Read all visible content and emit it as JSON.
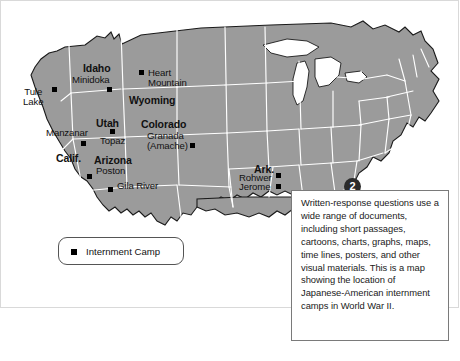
{
  "figure": {
    "type": "annotated-map",
    "title_visible": false,
    "map_region": "Continental United States",
    "map_fill_color": "#9b9b9b",
    "map_border_color": "#ffffff",
    "coastline_color": "#1a1a1a",
    "background_color": "#ffffff"
  },
  "badge": {
    "number": "2",
    "color": "#2b2b2b",
    "text_color": "#ffffff"
  },
  "callout": {
    "text": "Written-response questions use a wide range of documents, including short passages, cartoons, charts, graphs, maps, time lines, posters, and other visual materials. This is a map showing the location of Japanese-American internment camps in World War II.",
    "border_color": "#7a7a7a",
    "background": "#ffffff"
  },
  "legend": {
    "marker_shape": "square",
    "marker_color": "#000000",
    "label": "Internment Camp",
    "border_color": "#555555"
  },
  "states": [
    {
      "name": "Idaho",
      "x": 82,
      "y": 62
    },
    {
      "name": "Wyoming",
      "x": 128,
      "y": 94
    },
    {
      "name": "Utah",
      "x": 95,
      "y": 117
    },
    {
      "name": "Colorado",
      "x": 140,
      "y": 118
    },
    {
      "name": "Calif.",
      "x": 55,
      "y": 152
    },
    {
      "name": "Arizona",
      "x": 93,
      "y": 154
    },
    {
      "name": "Ark.",
      "x": 253,
      "y": 163
    }
  ],
  "camps": [
    {
      "name": "Tule Lake",
      "lines": [
        "Tule",
        "Lake"
      ],
      "label_x": 22,
      "label_y": 86,
      "marker_x": 51,
      "marker_y": 86
    },
    {
      "name": "Minidoka",
      "lines": [
        "Minidoka"
      ],
      "label_x": 71,
      "label_y": 74,
      "marker_x": 106,
      "marker_y": 86
    },
    {
      "name": "Heart Mountain",
      "lines": [
        "Heart",
        "Mountain"
      ],
      "label_x": 147,
      "label_y": 69,
      "marker_x": 139,
      "marker_y": 71
    },
    {
      "name": "Manzanar",
      "lines": [
        "Manzanar"
      ],
      "label_x": 45,
      "label_y": 127,
      "marker_x": 80,
      "marker_y": 140
    },
    {
      "name": "Topaz",
      "lines": [
        "Topaz"
      ],
      "label_x": 99,
      "label_y": 135,
      "marker_x": 109,
      "marker_y": 129
    },
    {
      "name": "Granada (Amache)",
      "lines": [
        "Granada",
        "(Amache)"
      ],
      "label_x": 146,
      "label_y": 131,
      "marker_x": 189,
      "marker_y": 142
    },
    {
      "name": "Poston",
      "lines": [
        "Poston"
      ],
      "label_x": 95,
      "label_y": 165,
      "marker_x": 86,
      "marker_y": 174
    },
    {
      "name": "Gila River",
      "lines": [
        "Gila River"
      ],
      "label_x": 116,
      "label_y": 180,
      "marker_x": 107,
      "marker_y": 186
    },
    {
      "name": "Rohwer",
      "lines": [
        "Rohwer"
      ],
      "label_x": 240,
      "label_y": 172,
      "marker_x": 275,
      "marker_y": 173
    },
    {
      "name": "Jerome",
      "lines": [
        "Jerome"
      ],
      "label_x": 240,
      "label_y": 181,
      "marker_x": 275,
      "marker_y": 183
    }
  ]
}
